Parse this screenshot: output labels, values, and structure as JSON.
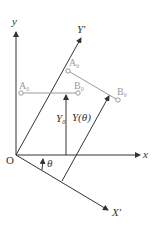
{
  "diagram": {
    "title": "",
    "colors": {
      "axis": "#333333",
      "bar": "#9a9a9a",
      "background": "#ffffff"
    },
    "origin": {
      "label": "O",
      "x": 16,
      "y": 155
    },
    "axes": {
      "x": {
        "label": "x"
      },
      "y": {
        "label": "y"
      },
      "X_prime": {
        "label": "X'"
      },
      "Y_prime": {
        "label": "Y'"
      }
    },
    "points": {
      "A0": {
        "main": "A",
        "sub": "0"
      },
      "B0": {
        "main": "B",
        "sub": "0"
      },
      "Atheta": {
        "main": "A",
        "sub": "θ"
      },
      "Btheta": {
        "main": "B",
        "sub": "θ"
      }
    },
    "measures": {
      "Y0": {
        "main": "Y",
        "sub": "0"
      },
      "Ytheta": {
        "label": "Y(θ)"
      },
      "theta": {
        "label": "θ"
      }
    }
  }
}
